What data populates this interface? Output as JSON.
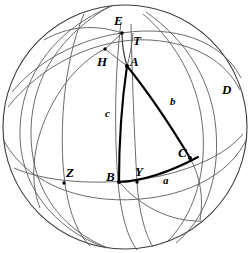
{
  "figure": {
    "kind": "spherical-trigonometry-diagram",
    "stroke_color": "#000000",
    "thin_stroke_color": "#4a4a4a",
    "background_color": "#ffffff",
    "sphere": {
      "center_x": 125,
      "center_y": 127,
      "radius_x": 123,
      "radius_y": 123
    },
    "labels": [
      {
        "id": "E",
        "text": "E",
        "x": 114,
        "y": 14,
        "size": "major"
      },
      {
        "id": "T",
        "text": "T",
        "x": 133,
        "y": 34,
        "size": "major"
      },
      {
        "id": "H",
        "text": "H",
        "x": 97,
        "y": 55,
        "size": "major"
      },
      {
        "id": "A",
        "text": "A",
        "x": 130,
        "y": 55,
        "size": "major"
      },
      {
        "id": "D",
        "text": "D",
        "x": 222,
        "y": 83,
        "size": "major"
      },
      {
        "id": "c",
        "text": "c",
        "x": 105,
        "y": 108,
        "size": "minor"
      },
      {
        "id": "b",
        "text": "b",
        "x": 170,
        "y": 96,
        "size": "minor"
      },
      {
        "id": "C",
        "text": "C",
        "x": 178,
        "y": 146,
        "size": "major"
      },
      {
        "id": "Z",
        "text": "Z",
        "x": 66,
        "y": 166,
        "size": "major"
      },
      {
        "id": "B",
        "text": "B",
        "x": 106,
        "y": 170,
        "size": "major"
      },
      {
        "id": "Y",
        "text": "Y",
        "x": 135,
        "y": 165,
        "size": "major"
      },
      {
        "id": "a",
        "text": "a",
        "x": 163,
        "y": 175,
        "size": "minor"
      }
    ],
    "vertices": [
      {
        "id": "E",
        "x": 122,
        "y": 33
      },
      {
        "id": "H",
        "x": 105,
        "y": 49
      },
      {
        "id": "A",
        "x": 127,
        "y": 66
      },
      {
        "id": "B",
        "x": 119,
        "y": 182
      },
      {
        "id": "C",
        "x": 190,
        "y": 158
      },
      {
        "id": "Y",
        "x": 137,
        "y": 182
      },
      {
        "id": "Z",
        "x": 64,
        "y": 183
      }
    ],
    "triangle_sides": [
      {
        "id": "side-c",
        "from": "A",
        "to": "B",
        "label": "c"
      },
      {
        "id": "side-b",
        "from": "A",
        "to": "C",
        "label": "b"
      },
      {
        "id": "side-a",
        "from": "B",
        "to": "C",
        "label": "a"
      }
    ]
  }
}
